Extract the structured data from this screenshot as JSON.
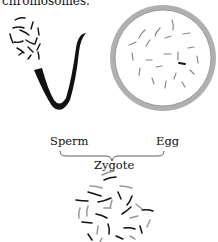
{
  "caption": "chromosomes.",
  "labels": {
    "sperm": "Sperm",
    "egg": "Egg",
    "zygote": "Zygote"
  },
  "colors": {
    "ink": "#111111",
    "egg_membrane": "#a8a8a8",
    "egg_chromosome": "#888888",
    "zygote_chromosome_light": "#999999"
  },
  "figure": {
    "type": "fertilization diagram",
    "parts": [
      "sperm with haploid chromosome set",
      "egg with haploid chromosome set",
      "zygote with diploid chromosome set"
    ]
  }
}
